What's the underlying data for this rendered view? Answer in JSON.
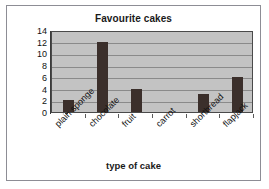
{
  "chart_data": {
    "type": "bar",
    "title": "Favourite cakes",
    "xlabel": "type of cake",
    "ylabel": "",
    "categories": [
      "plain sponge",
      "chocolate",
      "fruit",
      "carrot",
      "shortbread",
      "flapjack"
    ],
    "values": [
      2,
      12,
      4,
      0,
      3,
      6
    ],
    "yticks": [
      0,
      2,
      4,
      6,
      8,
      10,
      12,
      14
    ],
    "ylim": [
      0,
      14
    ],
    "grid": true,
    "legend": false,
    "bar_color": "#3b2f2b",
    "plot_background": "#c3c3c3"
  }
}
